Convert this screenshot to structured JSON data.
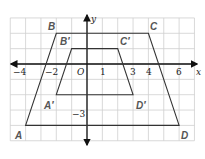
{
  "diagram": {
    "type": "coordinate-plane-dilation",
    "grid": {
      "x_min": -5,
      "x_max": 7,
      "y_min": -5,
      "y_max": 3,
      "origin_px": [
        87,
        64
      ],
      "unit_px": 15.35
    },
    "axes": {
      "x_label": "x",
      "y_label": "y",
      "origin_label": "O"
    },
    "x_tick_labels": [
      {
        "value": -4,
        "text": "−4"
      },
      {
        "value": -2,
        "text": "−2"
      },
      {
        "value": 1,
        "text": "1"
      },
      {
        "value": 3,
        "text": "3"
      },
      {
        "value": 4,
        "text": "4"
      },
      {
        "value": 6,
        "text": "6"
      }
    ],
    "y_tick_labels": [
      {
        "value": -3,
        "text": "−3"
      }
    ],
    "figures": [
      {
        "name": "ABCD",
        "vertices": [
          {
            "label": "A",
            "x": -4,
            "y": -4
          },
          {
            "label": "B",
            "x": -2,
            "y": 2
          },
          {
            "label": "C",
            "x": 4,
            "y": 2
          },
          {
            "label": "D",
            "x": 6,
            "y": -4
          }
        ]
      },
      {
        "name": "A'B'C'D'",
        "vertices": [
          {
            "label": "A′",
            "x": -2,
            "y": -2
          },
          {
            "label": "B′",
            "x": -1,
            "y": 1
          },
          {
            "label": "C′",
            "x": 2,
            "y": 1
          },
          {
            "label": "D′",
            "x": 3,
            "y": -2
          }
        ]
      }
    ],
    "labels": {
      "A": "A",
      "B": "B",
      "C": "C",
      "D": "D",
      "A_prime": "A′",
      "B_prime": "B′",
      "C_prime": "C′",
      "D_prime": "D′",
      "x": "x",
      "y": "y",
      "O": "O",
      "t_m4": "−4",
      "t_m2": "−2",
      "t_1": "1",
      "t_3": "3",
      "t_4": "4",
      "t_6": "6",
      "t_m3": "−3"
    },
    "colors": {
      "grid": "#cfcfcf",
      "axis": "#111111",
      "outline": "#333333",
      "vertex_label": "#555555"
    }
  }
}
